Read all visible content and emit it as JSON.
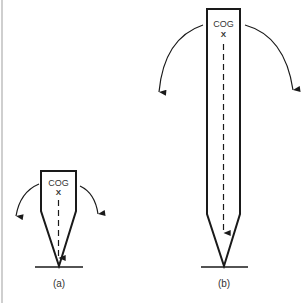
{
  "diagram": {
    "colors": {
      "stroke": "#1a1a1a",
      "text": "#333333",
      "background": "#ffffff",
      "edge": "#cfcfcf"
    },
    "figures": [
      {
        "id": "a",
        "caption": "(a)",
        "cog_label": "COG",
        "cog_marker": "X",
        "description": "Short pointed object balanced on its tip; centre of gravity low"
      },
      {
        "id": "b",
        "caption": "(b)",
        "cog_label": "COG",
        "cog_marker": "X",
        "description": "Tall pointed object balanced on its tip; centre of gravity high"
      }
    ]
  }
}
